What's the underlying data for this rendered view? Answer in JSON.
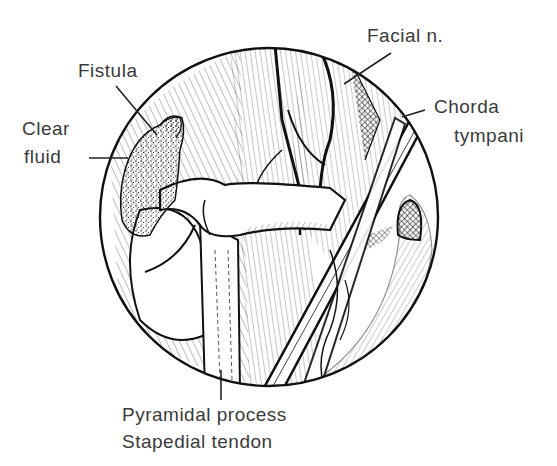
{
  "figure": {
    "type": "anatomical-illustration",
    "colors": {
      "ink": "#111111",
      "label_text": "#3a3a3a",
      "background": "#ffffff"
    }
  },
  "labels": {
    "fistula": "Fistula",
    "clear_fluid_line1": "Clear",
    "clear_fluid_line2": "fluid",
    "facial_nerve": "Facial n.",
    "chorda_line1": "Chorda",
    "chorda_line2": "tympani",
    "pyramidal": "Pyramidal process",
    "stapedial": "Stapedial tendon"
  }
}
